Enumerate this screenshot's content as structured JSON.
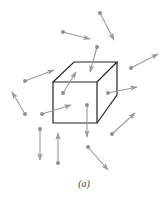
{
  "figure": {
    "caption": "(a)",
    "colors": {
      "cube": "#222222",
      "arrow": "#9a9a9a",
      "dot": "#8f8f8f"
    },
    "cube": {
      "front": [
        [
          53,
          82
        ],
        [
          97,
          82
        ],
        [
          97,
          123
        ],
        [
          53,
          123
        ]
      ],
      "back_top_left": [
        74,
        62
      ],
      "back_top_right": [
        117,
        62
      ],
      "back_bottom_right": [
        117,
        95
      ]
    },
    "arrows": [
      {
        "from": [
          100,
          13
        ],
        "to": [
          114,
          40
        ]
      },
      {
        "from": [
          63,
          32
        ],
        "to": [
          90,
          39
        ]
      },
      {
        "from": [
          97,
          47
        ],
        "to": [
          90,
          72
        ]
      },
      {
        "from": [
          25,
          81
        ],
        "to": [
          54,
          70
        ]
      },
      {
        "from": [
          131,
          68
        ],
        "to": [
          158,
          54
        ]
      },
      {
        "from": [
          63,
          93
        ],
        "to": [
          76,
          72
        ]
      },
      {
        "from": [
          108,
          93
        ],
        "to": [
          137,
          87
        ]
      },
      {
        "from": [
          25,
          114
        ],
        "to": [
          12,
          92
        ]
      },
      {
        "from": [
          42,
          114
        ],
        "to": [
          71,
          105
        ]
      },
      {
        "from": [
          87,
          105
        ],
        "to": [
          87,
          137
        ]
      },
      {
        "from": [
          40,
          129
        ],
        "to": [
          40,
          160
        ]
      },
      {
        "from": [
          58,
          163
        ],
        "to": [
          58,
          133
        ]
      },
      {
        "from": [
          112,
          134
        ],
        "to": [
          135,
          113
        ]
      },
      {
        "from": [
          88,
          147
        ],
        "to": [
          108,
          170
        ]
      }
    ]
  }
}
